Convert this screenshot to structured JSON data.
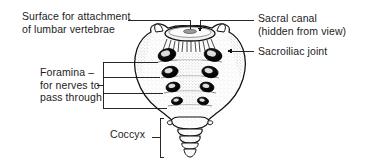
{
  "figure": {
    "background_color": "#ffffff",
    "ink_color": "#1c1c1c",
    "bone_fill_color": "#ffffff",
    "foramen_color": "#000000"
  },
  "labels": {
    "lumbar_surface": {
      "line1": "Surface for attachment",
      "line2": "of lumbar vertebrae"
    },
    "foramina": {
      "line1": "Foramina –",
      "line2": "for nerves to",
      "line3": "pass through"
    },
    "coccyx": {
      "line1": "Coccyx"
    },
    "sacral_canal": {
      "line1": "Sacral canal",
      "line2": "(hidden from view)"
    },
    "sacroiliac_joint": {
      "line1": "Sacroiliac joint"
    }
  },
  "annotations": {
    "foramina_count_pairs": 4,
    "leader_style": "thin-black-rule",
    "foramina_bracket": "four-rules-joined-by-vertical-stem",
    "coccyx_bracket": "vertical-stem-with-short-tick",
    "sacroiliac_leader": "rule-with-left-arrowhead",
    "sacral_canal_leader": "rule-with-down-hook-arrow"
  }
}
